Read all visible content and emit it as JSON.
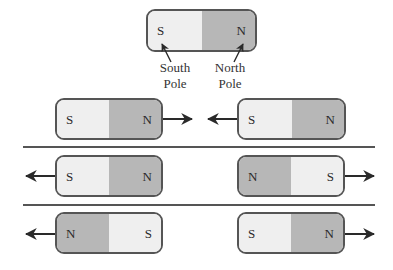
{
  "diagram": {
    "title_magnet": {
      "left_pole": "S",
      "right_pole": "N",
      "left_label_line1": "South",
      "left_label_line2": "Pole",
      "right_label_line1": "North",
      "right_label_line2": "Pole"
    },
    "rows": [
      {
        "left_magnet": {
          "left_pole": "S",
          "right_pole": "N",
          "arrow": "right"
        },
        "right_magnet": {
          "left_pole": "S",
          "right_pole": "N",
          "arrow": "left"
        }
      },
      {
        "left_magnet": {
          "left_pole": "S",
          "right_pole": "N",
          "arrow": "left"
        },
        "right_magnet": {
          "left_pole": "N",
          "right_pole": "S",
          "arrow": "right"
        }
      },
      {
        "left_magnet": {
          "left_pole": "N",
          "right_pole": "S",
          "arrow": "left"
        },
        "right_magnet": {
          "left_pole": "S",
          "right_pole": "N",
          "arrow": "right"
        }
      }
    ],
    "colors": {
      "south_fill": "#efefef",
      "north_fill": "#b7b7b7",
      "outline": "#555555",
      "arrow": "#2a2a2a"
    }
  }
}
